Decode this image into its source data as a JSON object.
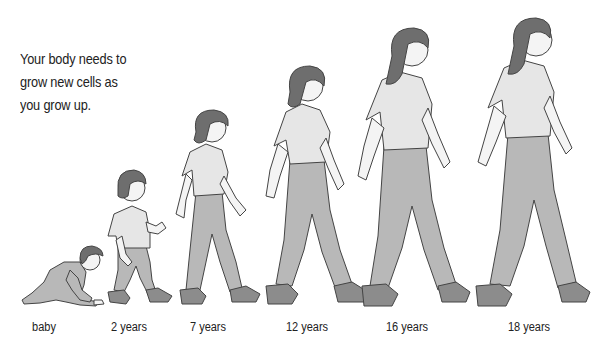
{
  "caption": {
    "lines": [
      "Your body needs to",
      "grow new cells as",
      "you grow up."
    ]
  },
  "stages": [
    {
      "label": "baby",
      "x": 44
    },
    {
      "label": "2 years",
      "x": 129
    },
    {
      "label": "7 years",
      "x": 208
    },
    {
      "label": "12 years",
      "x": 307
    },
    {
      "label": "16 years",
      "x": 407
    },
    {
      "label": "18 years",
      "x": 529
    }
  ],
  "colors": {
    "skin": "#f4f4f4",
    "hair": "#6e6e6e",
    "shirt": "#e6e6e6",
    "pants": "#b8b8b8",
    "shoe": "#8c8c8c",
    "outline": "#444444"
  }
}
